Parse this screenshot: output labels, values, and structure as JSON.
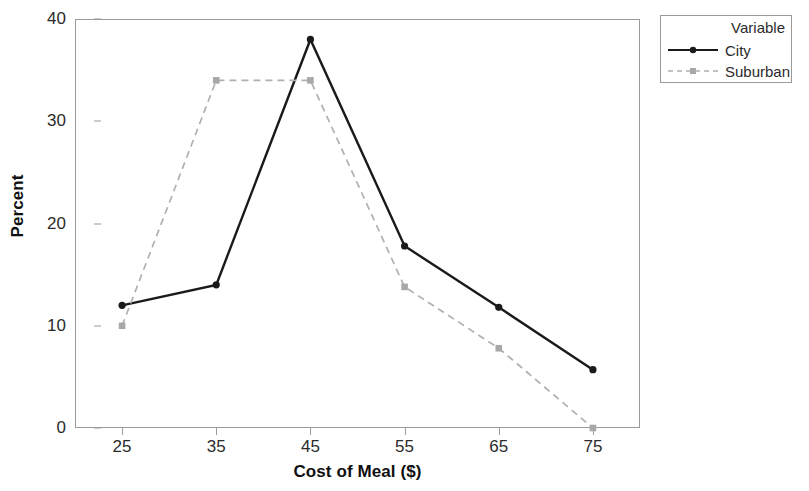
{
  "chart_data": {
    "type": "line",
    "title": "",
    "xlabel": "Cost of Meal ($)",
    "ylabel": "Percent",
    "x": [
      25,
      35,
      45,
      55,
      65,
      75
    ],
    "xtick_labels": [
      "25",
      "35",
      "45",
      "55",
      "65",
      "75"
    ],
    "ytick_labels": [
      "0",
      "10",
      "20",
      "30",
      "40"
    ],
    "ytick_values": [
      0,
      10,
      20,
      30,
      40
    ],
    "xlim": [
      20,
      80
    ],
    "ylim": [
      0,
      40
    ],
    "grid": false,
    "legend_position": "right-outside",
    "legend_title": "Variable",
    "series": [
      {
        "name": "City",
        "values": [
          12.0,
          14.0,
          38.0,
          17.8,
          11.8,
          5.7
        ],
        "color": "#1a1a1a",
        "linestyle": "solid",
        "marker": "circle"
      },
      {
        "name": "Suburban",
        "values": [
          10.0,
          34.0,
          34.0,
          13.8,
          7.8,
          0.0
        ],
        "color": "#b0b0b0",
        "linestyle": "dashed",
        "marker": "square"
      }
    ]
  },
  "axes": {
    "frame_color": "#9a9a9a"
  }
}
